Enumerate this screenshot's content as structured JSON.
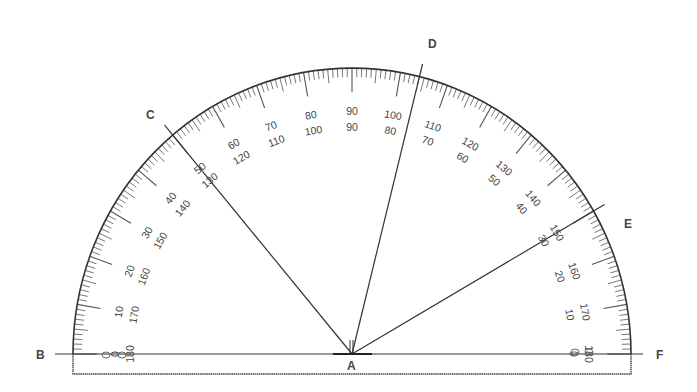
{
  "diagram": {
    "type": "protractor",
    "center_label": "A",
    "points": [
      {
        "label": "B",
        "angle_deg": 180
      },
      {
        "label": "C",
        "angle_deg": 130
      },
      {
        "label": "D",
        "angle_deg": 76
      },
      {
        "label": "E",
        "angle_deg": 30
      },
      {
        "label": "F",
        "angle_deg": 0
      }
    ],
    "outer_scale": [
      0,
      10,
      20,
      30,
      40,
      50,
      60,
      70,
      80,
      90,
      100,
      110,
      120,
      130,
      140,
      150,
      160,
      170,
      180
    ],
    "inner_scale": [
      180,
      170,
      160,
      150,
      140,
      130,
      120,
      110,
      100,
      90,
      80,
      70,
      60,
      50,
      40,
      30,
      20,
      10,
      0
    ],
    "colors": {
      "ink": "#333333",
      "background": "#ffffff"
    }
  }
}
